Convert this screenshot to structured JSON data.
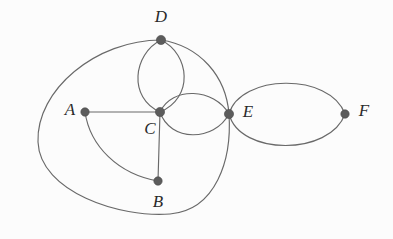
{
  "diagram": {
    "type": "graph",
    "width": 393,
    "height": 239,
    "background_color": "#fcfcfc",
    "edge_color": "#696969",
    "vertex_color": "#5c5c5c",
    "label_color": "#2a2a2a",
    "vertices": [
      {
        "id": "A",
        "label": "A",
        "x": 85,
        "y": 112,
        "label_x": 70,
        "label_y": 111,
        "r": 4.2
      },
      {
        "id": "B",
        "label": "B",
        "x": 158,
        "y": 181,
        "label_x": 158,
        "label_y": 203,
        "r": 4.2
      },
      {
        "id": "C",
        "label": "C",
        "x": 160,
        "y": 112,
        "label_x": 150,
        "label_y": 130,
        "r": 4.6
      },
      {
        "id": "D",
        "label": "D",
        "x": 161,
        "y": 40,
        "label_x": 161,
        "label_y": 18,
        "r": 4.6
      },
      {
        "id": "E",
        "label": "E",
        "x": 229,
        "y": 114,
        "label_x": 248,
        "label_y": 113,
        "r": 4.6
      },
      {
        "id": "F",
        "label": "F",
        "x": 345,
        "y": 114,
        "label_x": 364,
        "label_y": 112,
        "r": 4.2
      }
    ],
    "edges": [
      {
        "id": "e-A-C",
        "from": "A",
        "to": "C",
        "kind": "straight",
        "path": "M 85 112 L 160 112"
      },
      {
        "id": "e-C-B",
        "from": "C",
        "to": "B",
        "kind": "straight",
        "path": "M 160 112 L 158 181"
      },
      {
        "id": "e-A-B",
        "from": "A",
        "to": "B",
        "kind": "curve",
        "path": "M 85 112 C 90 146 118 174 158 181"
      },
      {
        "id": "e-D-C-left",
        "from": "D",
        "to": "C",
        "kind": "curve",
        "path": "M 161 40 C 133 54 128 98 160 112"
      },
      {
        "id": "e-D-C-right",
        "from": "D",
        "to": "C",
        "kind": "curve",
        "path": "M 161 40 C 190 54 194 98 160 112"
      },
      {
        "id": "e-C-E-top",
        "from": "C",
        "to": "E",
        "kind": "curve",
        "path": "M 160 112 C 172 86 214 88 229 114"
      },
      {
        "id": "e-C-E-bottom",
        "from": "C",
        "to": "E",
        "kind": "curve",
        "path": "M 160 112 C 170 142 214 142 229 114"
      },
      {
        "id": "e-D-E",
        "from": "D",
        "to": "E",
        "kind": "curve",
        "path": "M 161 40 C 200 46 226 76 229 114"
      },
      {
        "id": "e-E-F-top",
        "from": "E",
        "to": "F",
        "kind": "curve",
        "path": "M 229 114 C 240 74 330 72 345 114"
      },
      {
        "id": "e-E-F-bottom",
        "from": "E",
        "to": "F",
        "kind": "curve",
        "path": "M 229 114 C 240 156 330 156 345 114"
      },
      {
        "id": "e-D-E-outer",
        "from": "D",
        "to": "E",
        "kind": "outer-loop",
        "path": "M 161 40 C 96 40 36 90 38 142 C 40 192 120 218 170 214 C 216 210 232 160 229 114"
      }
    ]
  }
}
